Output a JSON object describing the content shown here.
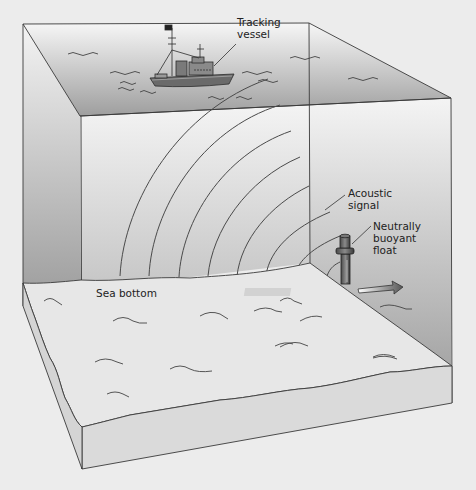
{
  "diagram": {
    "labels": {
      "vessel": "Tracking\nvessel",
      "signal": "Acoustic\nsignal",
      "float": "Neutrally\nbuoyant\nfloat",
      "bottom": "Sea bottom"
    },
    "components": [
      {
        "id": "tracking-vessel",
        "type": "ship",
        "position": "sea surface"
      },
      {
        "id": "acoustic-signal",
        "type": "concentric arcs",
        "count": 7,
        "origin": "float"
      },
      {
        "id": "neutrally-buoyant-float",
        "type": "instrument",
        "position": "near sea bottom"
      },
      {
        "id": "drift-arrow",
        "type": "arrow",
        "direction": "right"
      },
      {
        "id": "sea-bottom",
        "type": "sediment layer"
      }
    ],
    "colors": {
      "background": "#ececec",
      "water_top": "#f4f4f4",
      "water_bottom": "#a9a9a9",
      "sediment": "#e6e6e6",
      "sediment_side": "#d4d4d4",
      "stroke": "#3a3a3a"
    }
  }
}
